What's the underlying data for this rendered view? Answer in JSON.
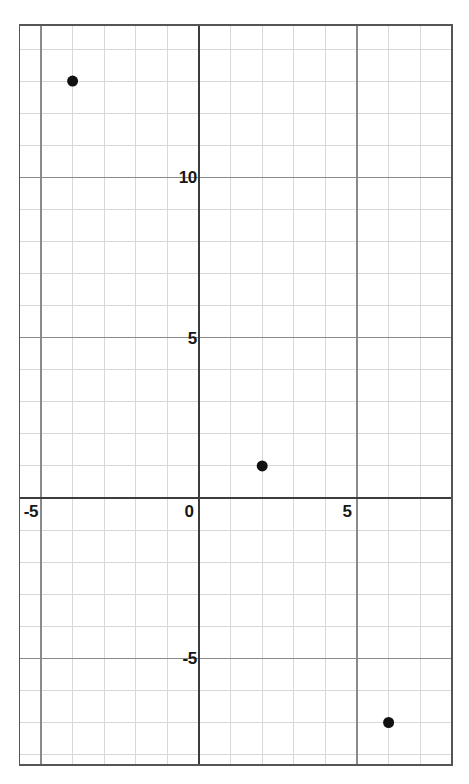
{
  "chart_data": {
    "type": "scatter",
    "title": "",
    "subtitle": "",
    "xlabel": "",
    "ylabel": "",
    "grid": true,
    "legend": "none",
    "xlim": [
      -5.7,
      8.0
    ],
    "ylim": [
      -8.3,
      14.75
    ],
    "x_major_ticks": [
      -5,
      0,
      5
    ],
    "y_major_ticks": [
      10,
      5,
      -5
    ],
    "x_tick_labels": [
      "-5",
      "0",
      "5"
    ],
    "y_tick_labels": [
      "10",
      "5",
      "-5"
    ],
    "major_tick_step": 5,
    "minor_tick_step": 1,
    "points": [
      {
        "label": "A",
        "x": -4,
        "y": 13
      },
      {
        "label": "B",
        "x": 2,
        "y": 1
      },
      {
        "label": "C",
        "x": 6,
        "y": -7
      }
    ],
    "series": [
      {
        "name": "points",
        "x": [
          -4,
          2,
          6
        ],
        "y": [
          13,
          1,
          -7
        ]
      }
    ],
    "colors": {
      "point": "#111111",
      "axis": "#3c3c3c",
      "major_grid": "#8a8a8a",
      "minor_grid": "#d8d8d8",
      "border": "#555555",
      "background": "#ffffff",
      "label": "#171717"
    },
    "point_radius_px": 5.5
  }
}
